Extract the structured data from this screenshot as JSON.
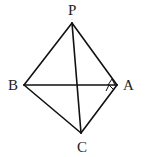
{
  "diagram": {
    "type": "geometry-figure",
    "points": {
      "P": {
        "label": "P",
        "x": 72,
        "y": 23,
        "label_x": 73,
        "label_y": 15
      },
      "B": {
        "label": "B",
        "x": 24,
        "y": 85,
        "label_x": 14,
        "label_y": 90
      },
      "A": {
        "label": "A",
        "x": 117,
        "y": 85,
        "label_x": 128,
        "label_y": 90
      },
      "C": {
        "label": "C",
        "x": 81,
        "y": 133,
        "label_x": 83,
        "label_y": 152
      }
    },
    "segments": [
      [
        "P",
        "B"
      ],
      [
        "P",
        "A"
      ],
      [
        "P",
        "C"
      ],
      [
        "B",
        "A"
      ],
      [
        "B",
        "C"
      ],
      [
        "A",
        "C"
      ]
    ],
    "angle_marks": [
      {
        "vertex": "A",
        "between": [
          "B",
          "C"
        ],
        "style": "small-triangle"
      }
    ],
    "colors": {
      "stroke": "#111111",
      "label": "#222222",
      "background": "#ffffff"
    }
  }
}
